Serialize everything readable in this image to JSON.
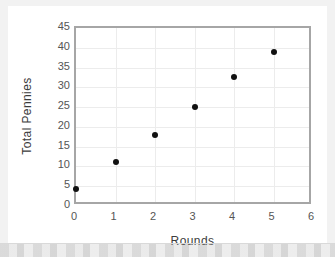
{
  "chart_data": {
    "type": "scatter",
    "title": "",
    "xlabel": "Rounds",
    "ylabel": "Total Pennies",
    "x": [
      0,
      1,
      2,
      3,
      4,
      5
    ],
    "values": [
      4.4,
      11,
      18,
      25,
      32.5,
      39
    ],
    "series": [
      {
        "name": "Total Pennies",
        "points": [
          {
            "x": 0,
            "y": 4.4
          },
          {
            "x": 1,
            "y": 11
          },
          {
            "x": 2,
            "y": 18
          },
          {
            "x": 3,
            "y": 25
          },
          {
            "x": 4,
            "y": 32.5
          },
          {
            "x": 5,
            "y": 39
          }
        ]
      }
    ],
    "xlim": [
      0,
      6
    ],
    "ylim": [
      0,
      45
    ],
    "xticks": [
      0,
      1,
      2,
      3,
      4,
      5,
      6
    ],
    "yticks": [
      0,
      5,
      10,
      15,
      20,
      25,
      30,
      35,
      40,
      45
    ],
    "xtick_labels": [
      "0",
      "1",
      "2",
      "3",
      "4",
      "5",
      "6"
    ],
    "ytick_labels": [
      "0",
      "5",
      "10",
      "15",
      "20",
      "25",
      "30",
      "35",
      "40",
      "45"
    ],
    "grid": true,
    "grid_horizontal_step": 5,
    "grid_vertical_step": 1,
    "legend": false,
    "legend_position": "none",
    "marker": "filled-circle",
    "marker_color": "#111111",
    "frame_color": "#a6a6a6",
    "grid_color": "#ececec",
    "plot_background": "#ffffff",
    "page_background": "#f2f2f2"
  }
}
